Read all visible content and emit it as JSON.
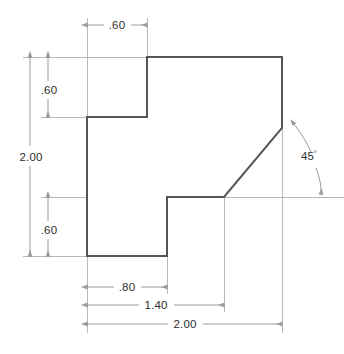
{
  "drawing": {
    "title": "Orthographic part outline with dimensions",
    "units_note": "",
    "colors": {
      "background": "#ffffff",
      "outline": "#555555",
      "dimension_line": "#9a9a9a",
      "extension_line": "#b4b4b4",
      "text": "#2e2e2e"
    },
    "outline": {
      "name": "part-profile",
      "closed": true,
      "vertices": [
        {
          "x": 147,
          "y": 57
        },
        {
          "x": 282,
          "y": 57
        },
        {
          "x": 282,
          "y": 128
        },
        {
          "x": 224,
          "y": 197
        },
        {
          "x": 167,
          "y": 197
        },
        {
          "x": 167,
          "y": 256
        },
        {
          "x": 87,
          "y": 256
        },
        {
          "x": 87,
          "y": 117
        },
        {
          "x": 147,
          "y": 117
        }
      ]
    },
    "dimensions": [
      {
        "id": "top-width-060",
        "label": ".60",
        "value": 0.6,
        "orientation": "horizontal",
        "line_y": 25,
        "from_x": 87,
        "to_x": 147,
        "text_x": 117,
        "text_y": 29
      },
      {
        "id": "upper-left-height-060",
        "label": ".60",
        "value": 0.6,
        "orientation": "vertical",
        "line_x": 48,
        "from_y": 57,
        "to_y": 117,
        "text_x": 48,
        "text_y": 92
      },
      {
        "id": "overall-height-200",
        "label": "2.00",
        "value": 2.0,
        "orientation": "vertical",
        "line_x": 30,
        "from_y": 57,
        "to_y": 256,
        "text_x": 32,
        "text_y": 160
      },
      {
        "id": "lower-left-height-060",
        "label": ".60",
        "value": 0.6,
        "orientation": "vertical",
        "line_x": 48,
        "from_y": 197,
        "to_y": 256,
        "text_x": 48,
        "text_y": 232
      },
      {
        "id": "bottom-width-080",
        "label": ".80",
        "value": 0.8,
        "orientation": "horizontal",
        "line_y": 287,
        "from_x": 87,
        "to_x": 167,
        "text_x": 127,
        "text_y": 291
      },
      {
        "id": "bottom-width-140",
        "label": "1.40",
        "value": 1.4,
        "orientation": "horizontal",
        "line_y": 305,
        "from_x": 87,
        "to_x": 224,
        "text_x": 156,
        "text_y": 309
      },
      {
        "id": "overall-width-200",
        "label": "2.00",
        "value": 2.0,
        "orientation": "horizontal",
        "line_y": 324,
        "from_x": 87,
        "to_x": 282,
        "text_x": 185,
        "text_y": 328
      }
    ],
    "angle": {
      "id": "chamfer-angle-45",
      "label": "45",
      "degree_symbol": "°",
      "value": 45,
      "unit": "degrees",
      "vertex_x": 282,
      "vertex_y": 197,
      "text_x": 306,
      "text_y": 159
    }
  }
}
